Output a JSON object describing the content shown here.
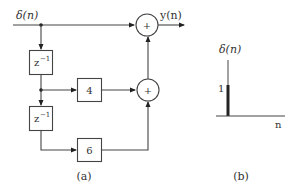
{
  "diagram_a": {
    "caption": "(a)",
    "input_label": "δ(n)",
    "output_label": "y(n)",
    "delay_blocks": [
      {
        "label": "z",
        "exponent": "−1"
      },
      {
        "label": "z",
        "exponent": "−1"
      }
    ],
    "gain_blocks": [
      {
        "label": "4"
      },
      {
        "label": "6"
      }
    ],
    "adders": [
      {
        "symbol": "+"
      },
      {
        "symbol": "+"
      }
    ]
  },
  "diagram_b": {
    "caption": "(b)",
    "y_label": "δ(n)",
    "x_label": "n",
    "impulse_value_label": "1"
  },
  "colors": {
    "stroke": "#444444",
    "text": "#333333",
    "background": "#ffffff"
  }
}
